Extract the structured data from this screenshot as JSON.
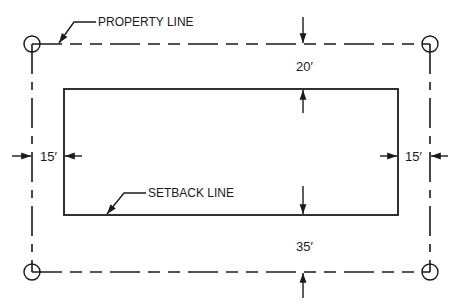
{
  "diagram": {
    "type": "site plan setback diagram",
    "colors": {
      "line": "#1a1a1a",
      "background": "#ffffff"
    },
    "labels": {
      "property_line": "PROPERTY LINE",
      "setback_line": "SETBACK LINE"
    },
    "dimensions": {
      "front": "20′",
      "rear": "35′",
      "left_side": "15′",
      "right_side": "15′"
    },
    "property_line": {
      "style": "phantom (long-short-short dash)",
      "corners": [
        "corner-marker-circle",
        "corner-marker-circle",
        "corner-marker-circle",
        "corner-marker-circle"
      ]
    },
    "setback_line": {
      "style": "solid rectangle"
    }
  }
}
